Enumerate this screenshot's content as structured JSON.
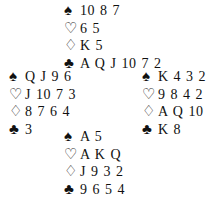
{
  "deal": {
    "north": {
      "spades": "10 8 7",
      "hearts": "6 5",
      "diamonds": "K 5",
      "clubs": "A Q J 10 7 2"
    },
    "west": {
      "spades": "Q J 9 6",
      "hearts": "J 10 7 3",
      "diamonds": "8 7 6 4",
      "clubs": "3"
    },
    "east": {
      "spades": "K 4 3 2",
      "hearts": "9 8 4 2",
      "diamonds": "A Q 10",
      "clubs": "K 8"
    },
    "south": {
      "spades": "A 5",
      "hearts": "A K Q",
      "diamonds": "J 9 3 2",
      "clubs": "9 6 5 4"
    }
  },
  "symbols": {
    "spades": "♠",
    "hearts": "♡",
    "diamonds": "♢",
    "clubs": "♣"
  }
}
